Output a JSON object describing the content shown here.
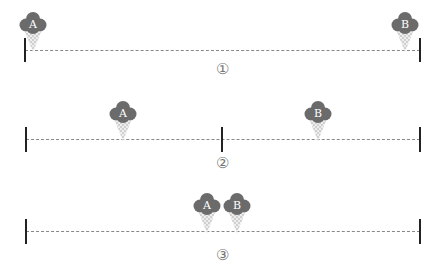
{
  "colors": {
    "scoop": "#6b6b6b",
    "cone": "#d4d4d4",
    "line": "#888888",
    "bar": "#222222",
    "text": "#777777"
  },
  "scenarios": [
    {
      "label": "①",
      "line_y": 50,
      "bars_x": [
        25,
        420
      ],
      "bar_top": 38,
      "bar_height": 24,
      "vendors": [
        {
          "name": "A",
          "x": 33
        },
        {
          "name": "B",
          "x": 405
        }
      ],
      "label_y": 61
    },
    {
      "label": "②",
      "line_y": 139,
      "bars_x": [
        26,
        222,
        420
      ],
      "bar_top": 127,
      "bar_height": 25,
      "vendors": [
        {
          "name": "A",
          "x": 123
        },
        {
          "name": "B",
          "x": 318
        }
      ],
      "label_y": 155
    },
    {
      "label": "③",
      "line_y": 231,
      "bars_x": [
        26,
        420
      ],
      "bar_top": 219,
      "bar_height": 25,
      "vendors": [
        {
          "name": "A",
          "x": 207
        },
        {
          "name": "B",
          "x": 237
        }
      ],
      "label_y": 247
    }
  ]
}
